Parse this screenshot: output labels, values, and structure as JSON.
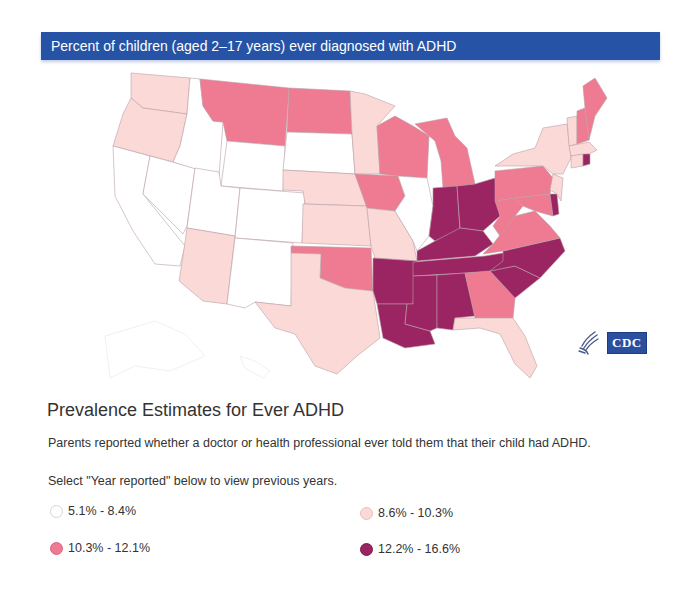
{
  "header": {
    "title": "Percent of children (aged 2–17 years) ever diagnosed with ADHD"
  },
  "map": {
    "logo": {
      "agency_mark": "HHS eagle",
      "text": "CDC"
    },
    "bins": [
      {
        "label": "5.1% - 8.4%",
        "color": "#ffffff"
      },
      {
        "label": "8.6% - 10.3%",
        "color": "#fbd9d7"
      },
      {
        "label": "10.3% - 12.1%",
        "color": "#ee7b91"
      },
      {
        "label": "12.2% - 16.6%",
        "color": "#9b2462"
      }
    ],
    "states": {
      "bin0": [
        "ID",
        "NV",
        "CA",
        "UT",
        "WY",
        "CO",
        "SD",
        "NM",
        "IL",
        "AK",
        "HI"
      ],
      "bin1": [
        "WA",
        "OR",
        "AZ",
        "NE",
        "KS",
        "MN",
        "MO",
        "TX",
        "FL",
        "NY",
        "VT",
        "MA",
        "CT",
        "NJ"
      ],
      "bin2": [
        "MT",
        "ND",
        "IA",
        "WI",
        "MI",
        "OK",
        "GA",
        "PA",
        "WV",
        "VA",
        "MD",
        "NH",
        "ME"
      ],
      "bin3": [
        "IN",
        "OH",
        "KY",
        "TN",
        "AR",
        "LA",
        "MS",
        "AL",
        "NC",
        "SC",
        "DE",
        "RI"
      ]
    }
  },
  "content": {
    "section_title": "Prevalence Estimates for Ever ADHD",
    "description": "Parents reported whether a doctor or health professional ever told them that their child had ADHD.",
    "note": "Select \"Year reported\" below to view previous years."
  },
  "legend": [
    {
      "label": "5.1% - 8.4%",
      "color": "#ffffff"
    },
    {
      "label": "8.6% - 10.3%",
      "color": "#fbd9d7"
    },
    {
      "label": "10.3% - 12.1%",
      "color": "#ee7b91"
    },
    {
      "label": "12.2% - 16.6%",
      "color": "#9b2462"
    }
  ]
}
